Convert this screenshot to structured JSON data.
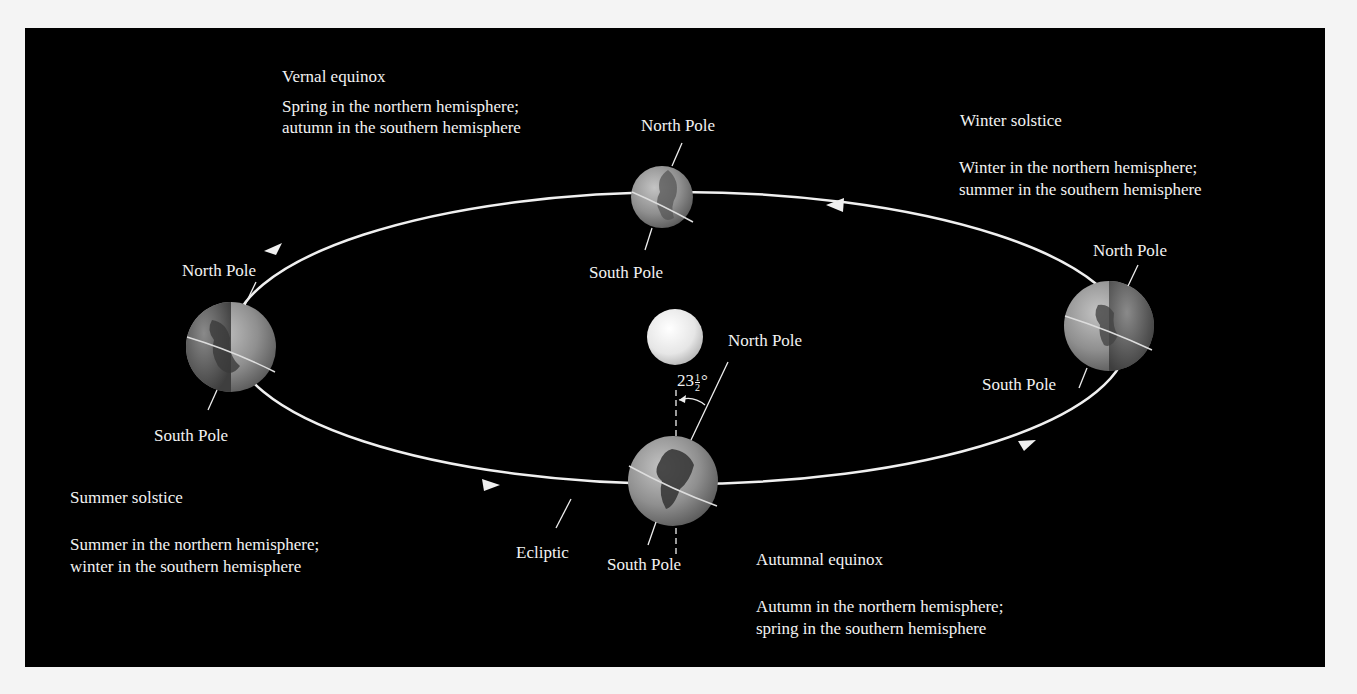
{
  "diagram": {
    "colors": {
      "background": "#000000",
      "page": "#f4f4f4",
      "orbit": "#f0f0f0",
      "text": "#f2f2f2",
      "sun": "#f5f5f5",
      "earth_light": "#a9a9a9",
      "earth_dark": "#5c5c5c"
    },
    "sun": {
      "label": ""
    },
    "tilt_angle": "23½°",
    "tilt_whole": "23",
    "tilt_frac_num": "1",
    "tilt_frac_den": "2",
    "tilt_degree": "°",
    "ecliptic_label": "Ecliptic",
    "positions": [
      {
        "id": "vernal",
        "name": "Vernal equinox",
        "desc_line1": "Spring in the northern hemisphere;",
        "desc_line2": "autumn in the southern hemisphere",
        "north_label": "North Pole",
        "south_label": "South Pole"
      },
      {
        "id": "winter",
        "name": "Winter solstice",
        "desc_line1": "Winter in the northern hemisphere;",
        "desc_line2": "summer in the southern hemisphere",
        "north_label": "North Pole",
        "south_label": "South Pole"
      },
      {
        "id": "autumnal",
        "name": "Autumnal equinox",
        "desc_line1": "Autumn in the northern hemisphere;",
        "desc_line2": "spring in the southern hemisphere",
        "north_label": "North Pole",
        "south_label": "South Pole"
      },
      {
        "id": "summer",
        "name": "Summer solstice",
        "desc_line1": "Summer in the northern hemisphere;",
        "desc_line2": "winter in the southern hemisphere",
        "north_label": "North Pole",
        "south_label": "South Pole"
      }
    ]
  }
}
